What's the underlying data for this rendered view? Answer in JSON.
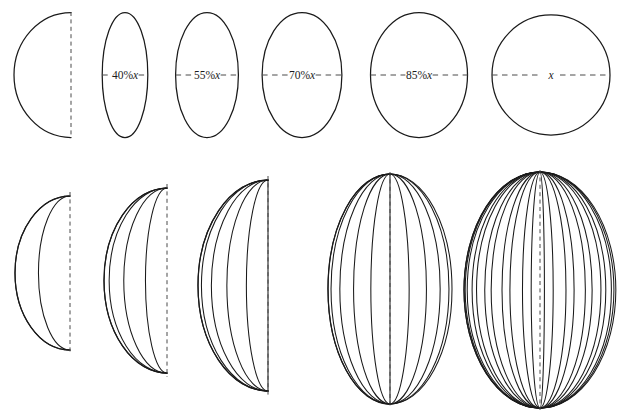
{
  "figure": {
    "background_color": "#ffffff",
    "stroke_color": "#1a1a1a",
    "axis_color": "#4a4a4a",
    "width": 626,
    "height": 417,
    "caption": ""
  },
  "top_row": {
    "name": "cross-section-sequence",
    "description": "Sequence of ellipse cross-sections of increasing width, each bisected by a dashed horizontal diameter line; the first is a half-ellipse with a dashed vertical axis.",
    "common_height": 125,
    "center_y": 75,
    "panels": [
      {
        "index": 0,
        "label": "",
        "label_percent": null,
        "shape": "half-ellipse-left",
        "rx": 57,
        "ry": 62.5,
        "center_x": 71,
        "axis": "vertical-dashed",
        "axis_x": 71
      },
      {
        "index": 1,
        "label": "40%x",
        "label_percent": 40,
        "label_prefix": "40%",
        "label_var": "x",
        "shape": "ellipse",
        "rx": 22.8,
        "ry": 62.5,
        "center_x": 125,
        "axis": "horizontal-dashed",
        "axis_half_width": 22.8
      },
      {
        "index": 2,
        "label": "55%x",
        "label_percent": 55,
        "label_prefix": "55%",
        "label_var": "x",
        "shape": "ellipse",
        "rx": 31.4,
        "ry": 62.5,
        "center_x": 207,
        "axis": "horizontal-dashed",
        "axis_half_width": 31.4
      },
      {
        "index": 3,
        "label": "70%x",
        "label_percent": 70,
        "label_prefix": "70%",
        "label_var": "x",
        "shape": "ellipse",
        "rx": 39.9,
        "ry": 62.5,
        "center_x": 302,
        "axis": "horizontal-dashed",
        "axis_half_width": 39.9
      },
      {
        "index": 4,
        "label": "85%x",
        "label_percent": 85,
        "label_prefix": "85%",
        "label_var": "x",
        "shape": "ellipse",
        "rx": 48.5,
        "ry": 62.5,
        "center_x": 419,
        "axis": "horizontal-dashed",
        "axis_half_width": 48.5
      },
      {
        "index": 5,
        "label": "x",
        "label_percent": 100,
        "label_prefix": "",
        "label_var": "x",
        "shape": "circle",
        "rx": 59,
        "ry": 60,
        "center_x": 551,
        "axis": "horizontal-dashed",
        "axis_half_width": 59
      }
    ]
  },
  "bottom_row": {
    "name": "revolution-sequence",
    "description": "Progressive sweep of a half-ellipse rotated about a vertical axis; each panel adds more intermediate rotated copies, approximating a solid of revolution.",
    "panels": [
      {
        "index": 0,
        "copies": 2,
        "max_angle_deg": 55,
        "center_x": 70,
        "top_y": 196,
        "bottom_y": 350,
        "rx": 55,
        "ry": 77,
        "axis_x": 70,
        "axis_top": 192,
        "axis_bottom": 354
      },
      {
        "index": 1,
        "copies": 4,
        "max_angle_deg": 70,
        "center_x": 167,
        "top_y": 188,
        "bottom_y": 373,
        "rx": 63,
        "ry": 92.5,
        "axis_x": 167,
        "axis_top": 184,
        "axis_bottom": 377
      },
      {
        "index": 2,
        "copies": 6,
        "max_angle_deg": 90,
        "center_x": 268,
        "top_y": 180,
        "bottom_y": 391,
        "rx": 70,
        "ry": 105.5,
        "axis_x": 268,
        "axis_top": 176,
        "axis_bottom": 395
      },
      {
        "index": 3,
        "copies": 11,
        "max_angle_deg": 180,
        "center_x": 390,
        "top_y": 174,
        "bottom_y": 404,
        "rx": 62,
        "ry": 115,
        "axis_x": 390,
        "axis_top": 172,
        "axis_bottom": 406
      },
      {
        "index": 4,
        "copies": 22,
        "max_angle_deg": 350,
        "center_x": 540,
        "top_y": 172,
        "bottom_y": 408,
        "rx": 76,
        "ry": 118,
        "axis_x": 540,
        "axis_top": 170,
        "axis_bottom": 410
      }
    ]
  }
}
